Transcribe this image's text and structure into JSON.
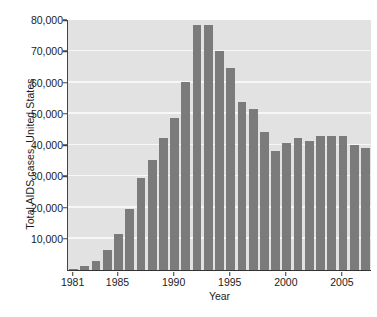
{
  "chart_data": {
    "type": "bar",
    "title": "",
    "xlabel": "Year",
    "ylabel": "Total AIDS cases, United States",
    "ylim": [
      0,
      80000
    ],
    "ytick_values": [
      10000,
      20000,
      30000,
      40000,
      50000,
      60000,
      70000,
      80000
    ],
    "ytick_labels": [
      "10,000",
      "20,000",
      "30,000",
      "40,000",
      "50,000",
      "60,000",
      "70,000",
      "80,000"
    ],
    "xtick_labels": [
      "1981",
      "1985",
      "1990",
      "1995",
      "2000",
      "2005"
    ],
    "xtick_categories": [
      "1981",
      "1985",
      "1990",
      "1995",
      "2000",
      "2005"
    ],
    "grid": true,
    "legend": "none",
    "categories": [
      "1981",
      "1982",
      "1983",
      "1984",
      "1985",
      "1986",
      "1987",
      "1988",
      "1989",
      "1990",
      "1991",
      "1992",
      "1993",
      "1994",
      "1995",
      "1996",
      "1997",
      "1998",
      "1999",
      "2000",
      "2001",
      "2002",
      "2003",
      "2004",
      "2005",
      "2006",
      "2007"
    ],
    "values": [
      300,
      1300,
      3000,
      6400,
      11500,
      19600,
      29500,
      35200,
      42200,
      48500,
      60200,
      78500,
      78500,
      70200,
      64500,
      53700,
      51500,
      44100,
      38000,
      40600,
      42200,
      41300,
      42900,
      42900,
      42900,
      40100,
      39200
    ],
    "bar_color": "#7b7b7b",
    "plot_background": "#e2e2e2",
    "gridline_color": "#f7f7f7",
    "axis_color": "#333333",
    "text_color": "#1b1b1b"
  }
}
